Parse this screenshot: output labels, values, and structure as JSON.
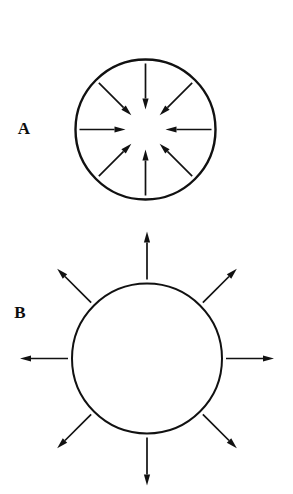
{
  "figure": {
    "background_color": "#ffffff",
    "ink_color": "#111111",
    "width": 293,
    "height": 494,
    "panels": [
      {
        "id": "A",
        "label": "A",
        "label_x": 24,
        "label_y": 134,
        "name": "compression-panel",
        "circle": {
          "cx": 145.5,
          "cy": 129.5,
          "r": 70,
          "stroke_width": 2.4
        },
        "arrow_direction": "inward",
        "arrow_count": 8,
        "arrow_start_radius": 66,
        "arrow_end_radius": 20,
        "arrow_shaft_width": 1.7,
        "arrow_head_length": 11,
        "arrow_head_width": 6.2,
        "arrow_angles_deg": [
          0,
          45,
          90,
          135,
          180,
          225,
          270,
          315
        ]
      },
      {
        "id": "B",
        "label": "B",
        "label_x": 20,
        "label_y": 318,
        "name": "tension-panel",
        "circle": {
          "cx": 147,
          "cy": 358.5,
          "r": 75,
          "stroke_width": 2.0
        },
        "arrow_direction": "outward",
        "arrow_count": 8,
        "arrow_start_radius": 79,
        "arrow_end_radius": 127,
        "arrow_shaft_width": 1.7,
        "arrow_head_length": 11,
        "arrow_head_width": 6.2,
        "arrow_angles_deg": [
          0,
          45,
          90,
          135,
          180,
          225,
          270,
          315
        ]
      }
    ]
  },
  "chart_data": {
    "type": "diagram",
    "title": "",
    "subtitle": "",
    "panels": [
      {
        "label": "A",
        "shape": "circle",
        "arrow_direction": "inward",
        "arrow_count": 8,
        "meaning": "compression / convergence",
        "arrow_angles_deg": [
          0,
          45,
          90,
          135,
          180,
          225,
          270,
          315
        ]
      },
      {
        "label": "B",
        "shape": "circle",
        "arrow_direction": "outward",
        "arrow_count": 8,
        "meaning": "tension / divergence",
        "arrow_angles_deg": [
          0,
          45,
          90,
          135,
          180,
          225,
          270,
          315
        ]
      }
    ],
    "legend": [],
    "xlabel": "",
    "ylabel": ""
  }
}
